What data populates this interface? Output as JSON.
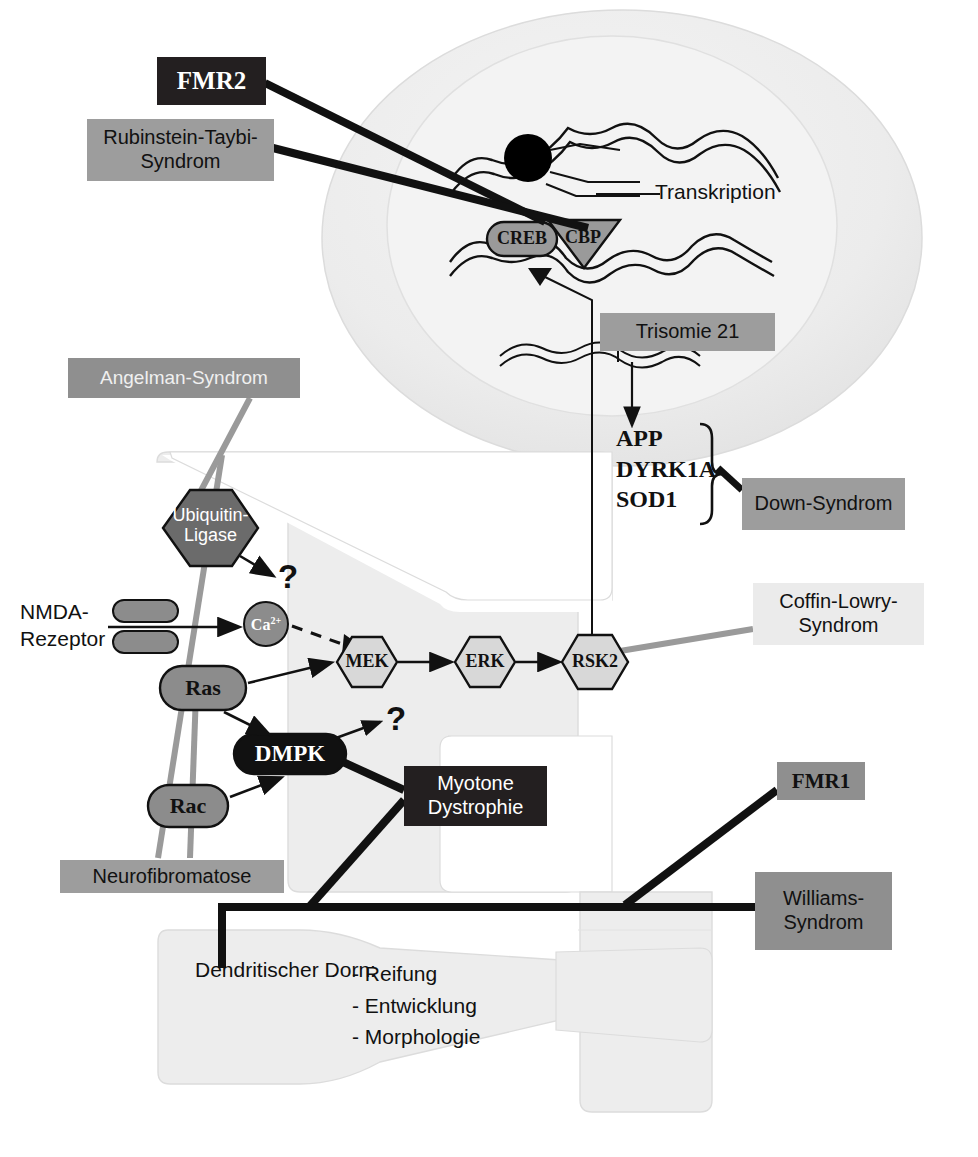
{
  "figure": {
    "language": "de"
  },
  "colors": {
    "dark_box": "#231f20",
    "mid_gray_box": "#9d9d9d",
    "light_gray_box": "#ebebeb",
    "cell_fill": "#ededed",
    "nucleus_fill": "#f2f2f2",
    "soma_fill": "#e8e8e8",
    "node_gray": "#8c8c8c",
    "node_light": "#d8d8d8",
    "node_dark": "#6b6b6b",
    "black": "#000000",
    "connector_gray": "#9a9a9a"
  },
  "syndrome_labels": [
    {
      "id": "fmr2",
      "text": "FMR2",
      "style": "dark",
      "font": "serif"
    },
    {
      "id": "rubinstein_taybi",
      "text": "Rubinstein-Taybi-\nSyndrom",
      "style": "mid",
      "font": "sans"
    },
    {
      "id": "angelman",
      "text": "Angelman-Syndrom",
      "style": "midd",
      "font": "sans"
    },
    {
      "id": "trisomie21",
      "text": "Trisomie 21",
      "style": "mid",
      "font": "sans"
    },
    {
      "id": "down",
      "text": "Down-Syndrom",
      "style": "mid",
      "font": "sans"
    },
    {
      "id": "coffin_lowry",
      "text": "Coffin-Lowry-\nSyndrom",
      "style": "light",
      "font": "sans"
    },
    {
      "id": "myotone",
      "text": "Myotone\nDystrophie",
      "style": "dark",
      "font": "sans"
    },
    {
      "id": "neurofibromatose",
      "text": "Neurofibromatose",
      "style": "mid",
      "font": "sans"
    },
    {
      "id": "fmr1",
      "text": "FMR1",
      "style": "midd",
      "font": "serif"
    },
    {
      "id": "williams",
      "text": "Williams-\nSyndrom",
      "style": "midd",
      "font": "sans"
    }
  ],
  "labels": {
    "fmr2": "FMR2",
    "rubinstein_taybi_l1": "Rubinstein-Taybi-",
    "rubinstein_taybi_l2": "Syndrom",
    "angelman": "Angelman-Syndrom",
    "trisomie21": "Trisomie 21",
    "down": "Down-Syndrom",
    "coffin_lowry_l1": "Coffin-Lowry-",
    "coffin_lowry_l2": "Syndrom",
    "myotone_l1": "Myotone",
    "myotone_l2": "Dystrophie",
    "neurofibromatose": "Neurofibromatose",
    "fmr1": "FMR1",
    "williams_l1": "Williams-",
    "williams_l2": "Syndrom"
  },
  "nucleus": {
    "transkription": "Transkription",
    "creb": "CREB",
    "cbp": "CBP",
    "genes": [
      "APP",
      "DYRK1A",
      "SOD1"
    ]
  },
  "pathway_nodes": [
    {
      "id": "nmda",
      "label": "NMDA-\nRezeptor",
      "shape": "receptor",
      "fill": "#8c8c8c"
    },
    {
      "id": "ca",
      "label": "Ca2+",
      "shape": "circle",
      "fill": "#8c8c8c"
    },
    {
      "id": "mek",
      "label": "MEK",
      "shape": "hexagon",
      "fill": "#d8d8d8"
    },
    {
      "id": "erk",
      "label": "ERK",
      "shape": "hexagon",
      "fill": "#d8d8d8"
    },
    {
      "id": "rsk2",
      "label": "RSK2",
      "shape": "hexagon",
      "fill": "#d8d8d8"
    },
    {
      "id": "ras",
      "label": "Ras",
      "shape": "oval",
      "fill": "#8c8c8c"
    },
    {
      "id": "rac",
      "label": "Rac",
      "shape": "oval",
      "fill": "#8c8c8c"
    },
    {
      "id": "dmpk",
      "label": "DMPK",
      "shape": "oval",
      "fill": "#111111"
    },
    {
      "id": "ubiq",
      "label": "Ubiquitin-\nLigase",
      "shape": "hexagon",
      "fill": "#6b6b6b"
    }
  ],
  "pathway_text": {
    "nmda_l1": "NMDA-",
    "nmda_l2": "Rezeptor",
    "ca": "Ca",
    "ca_sup": "2+",
    "mek": "MEK",
    "erk": "ERK",
    "rsk2": "RSK2",
    "ras": "Ras",
    "rac": "Rac",
    "dmpk": "DMPK",
    "ubiquitin_l1": "Ubiquitin-",
    "ubiquitin_l2": "Ligase",
    "question_1": "?",
    "question_2": "?"
  },
  "dendritic_spine": {
    "heading": "Dendritischer Dorn:",
    "items": [
      "- Reifung",
      "- Entwicklung",
      "- Morphologie"
    ]
  },
  "gene_list": {
    "app": "APP",
    "dyrk1a": "DYRK1A",
    "sod1": "SOD1"
  },
  "connections": [
    {
      "from": "fmr2",
      "to": "nucleus-transcription-factor",
      "weight": "thick",
      "color": "black"
    },
    {
      "from": "rubinstein_taybi",
      "to": "cbp",
      "weight": "thick",
      "color": "black"
    },
    {
      "from": "angelman",
      "to": "ubiq",
      "weight": "medium",
      "color": "gray"
    },
    {
      "from": "down",
      "to": "gene-brace",
      "weight": "thick",
      "color": "black"
    },
    {
      "from": "coffin_lowry",
      "to": "rsk2",
      "weight": "medium",
      "color": "gray"
    },
    {
      "from": "myotone",
      "to": "dmpk",
      "weight": "thick",
      "color": "black"
    },
    {
      "from": "neurofibromatose",
      "to": "ras",
      "weight": "medium",
      "color": "gray"
    },
    {
      "from": "neurofibromatose",
      "to": "rac",
      "weight": "medium",
      "color": "gray"
    },
    {
      "from": "fmr1",
      "to": "dendrite-trunk",
      "weight": "thick",
      "color": "black"
    },
    {
      "from": "williams",
      "to": "dendrite-trunk",
      "weight": "thick",
      "color": "black"
    },
    {
      "from": "trisomie21",
      "to": "dna-strand",
      "weight": "thin",
      "color": "black"
    },
    {
      "from": "rsk2",
      "to": "creb",
      "weight": "thin",
      "color": "black"
    }
  ]
}
